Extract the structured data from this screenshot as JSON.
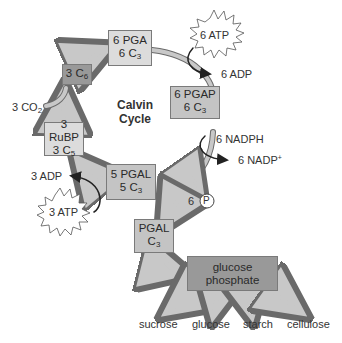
{
  "title": "Calvin Cycle",
  "center_label": {
    "line1": "Calvin",
    "line2": "Cycle"
  },
  "boxes": {
    "pga": {
      "line1": "6 PGA",
      "line2_main": "6 C",
      "line2_sub": "3"
    },
    "c6": {
      "line1_main": "3 C",
      "line1_sub": "6"
    },
    "pgap": {
      "line1": "6 PGAP",
      "line2_main": "6 C",
      "line2_sub": "3"
    },
    "rubp": {
      "line1": "3 RuBP",
      "line2_main": "3 C",
      "line2_sub": "5"
    },
    "pgal5": {
      "line1": "5 PGAL",
      "line2_main": "5 C",
      "line2_sub": "3"
    },
    "pgal": {
      "line1": "PGAL",
      "line2_main": "C",
      "line2_sub": "3"
    },
    "glucose_phosphate": {
      "line1": "glucose",
      "line2": "phosphate"
    }
  },
  "labels": {
    "co2": {
      "main": "3 CO",
      "sub": "2"
    },
    "atp6": "6 ATP",
    "adp6": "6 ADP",
    "nadph": "6 NADPH",
    "nadp": {
      "main": "6 NADP",
      "sup": "+"
    },
    "phosphate_count": "6",
    "phosphate_symbol": "P",
    "adp3": "3 ADP",
    "atp3": "3 ATP"
  },
  "products": [
    "sucrose",
    "glucose",
    "starch",
    "cellulose"
  ],
  "colors": {
    "light_box": "#dcdcdc",
    "mid_box": "#c4c4c4",
    "dark_box": "#999999",
    "arrow_fill": "#c8c8c8",
    "outline": "#6a6a6a"
  }
}
